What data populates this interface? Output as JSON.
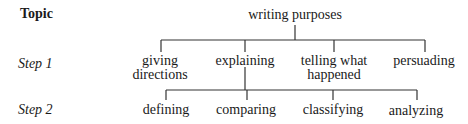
{
  "row_labels": {
    "topic": "Topic",
    "step1": "Step 1",
    "step2": "Step 2"
  },
  "tree": {
    "root": "writing purposes",
    "step1": [
      {
        "line1": "giving",
        "line2": "directions"
      },
      {
        "line1": "explaining",
        "line2": ""
      },
      {
        "line1": "telling what",
        "line2": "happened"
      },
      {
        "line1": "persuading",
        "line2": ""
      }
    ],
    "step2_parent": "explaining",
    "step2": [
      "defining",
      "comparing",
      "classifying",
      "analyzing"
    ]
  }
}
